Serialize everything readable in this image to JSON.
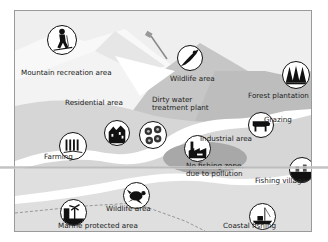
{
  "diagram": {
    "type": "illustrated land-use map",
    "colors": {
      "sky": "#efefef",
      "mountain_light": "#f7f7f7",
      "mountain_mid": "#c9c9c9",
      "mountain_dark": "#b4b4b4",
      "land": "#d9d9d9",
      "river": "#ffffff",
      "pollution_zone": "#a9a9a9",
      "sea": "#e2e2e2",
      "icon_fill": "#111111"
    },
    "labels": {
      "mountain_recreation": "Mountain recreation area",
      "wildlife_upper": "Wildlife area",
      "forest_plantation": "Forest plantation",
      "residential": "Residential area",
      "dirty_water_line1": "Dirty water",
      "dirty_water_line2": "treatment plant",
      "grazing": "Grazing",
      "industrial": "Industrial area",
      "farming": "Farming",
      "no_fishing_line1": "No fishing zone,",
      "no_fishing_line2": "due to pollution",
      "fishing_village": "Fishing village",
      "wildlife_lower": "Wildlife area",
      "coastal_fishing": "Coastal fishing",
      "marine_protected": "Marine protected area"
    },
    "icons": [
      {
        "id": "skier",
        "semantic": "skier-icon"
      },
      {
        "id": "eagle",
        "semantic": "eagle-icon"
      },
      {
        "id": "trees",
        "semantic": "pine-trees-icon"
      },
      {
        "id": "houses",
        "semantic": "houses-icon"
      },
      {
        "id": "sewage",
        "semantic": "sewage-tanks-icon"
      },
      {
        "id": "cow",
        "semantic": "cow-icon"
      },
      {
        "id": "factory",
        "semantic": "factory-icon"
      },
      {
        "id": "wheat",
        "semantic": "wheat-icon"
      },
      {
        "id": "village",
        "semantic": "village-icon"
      },
      {
        "id": "turtle",
        "semantic": "turtle-icon"
      },
      {
        "id": "palm",
        "semantic": "palm-tree-icon"
      },
      {
        "id": "boat",
        "semantic": "fishing-boat-icon"
      }
    ]
  }
}
